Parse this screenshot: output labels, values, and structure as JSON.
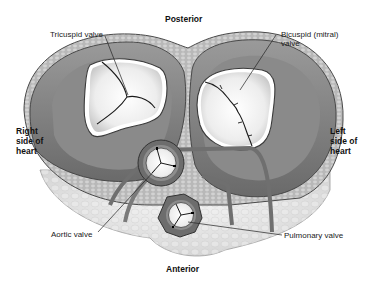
{
  "diagram": {
    "orientation": {
      "top": "Posterior",
      "bottom": "Anterior",
      "left": "Right side of heart",
      "right": "Left side of heart"
    },
    "labels": {
      "posterior": "Posterior",
      "anterior": "Anterior",
      "right_side": [
        "Right",
        "side of",
        "heart"
      ],
      "left_side": [
        "Left",
        "side of",
        "heart"
      ],
      "tricuspid": "Tricuspid valve",
      "bicuspid": [
        "Bicuspid (mitral)",
        "valve"
      ],
      "aortic": "Aortic valve",
      "pulmonary": "Pulmonary valve"
    },
    "structures": [
      {
        "name": "Tricuspid valve",
        "cusps": 3,
        "position": "upper-left"
      },
      {
        "name": "Bicuspid (mitral) valve",
        "cusps": 2,
        "position": "upper-right"
      },
      {
        "name": "Aortic valve",
        "cusps": 3,
        "position": "center"
      },
      {
        "name": "Pulmonary valve",
        "cusps": 3,
        "position": "lower-center"
      }
    ],
    "colors": {
      "muscle_dark": "#6e6e6e",
      "muscle_mid": "#8c8c8c",
      "muscle_light": "#a8a8a8",
      "fat": "#e6e6e6",
      "valve_leaflet": "#f4f4f4",
      "outline": "#3a3a3a",
      "text": "#222222"
    }
  }
}
